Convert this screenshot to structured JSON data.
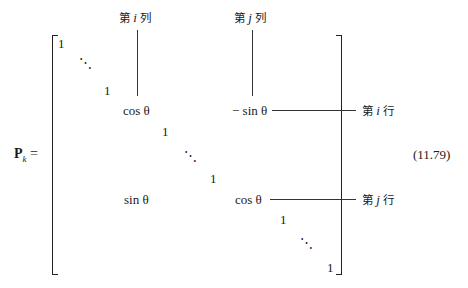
{
  "equation": {
    "lhs_symbol": "P",
    "lhs_subscript": "k",
    "equals": "=",
    "number": "(11.79)"
  },
  "labels": {
    "col_i": {
      "prefix": "第",
      "var": "i",
      "suffix": "列"
    },
    "col_j": {
      "prefix": "第",
      "var": "j",
      "suffix": "列"
    },
    "row_i": {
      "prefix": "第",
      "var": "i",
      "suffix": "行"
    },
    "row_j": {
      "prefix": "第",
      "var": "j",
      "suffix": "行"
    }
  },
  "matrix": {
    "one": "1",
    "ddots": "⋱",
    "cos_theta": "cos θ",
    "neg_sin_theta": "− sin θ",
    "sin_theta": "sin θ",
    "cos_theta_2": "cos θ"
  }
}
